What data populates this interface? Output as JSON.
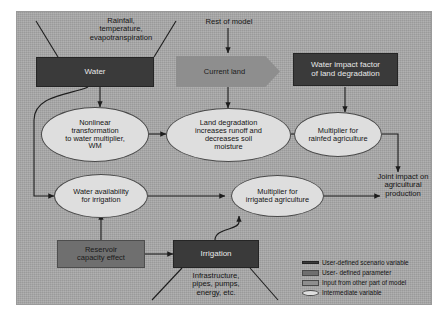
{
  "diagram": {
    "background_color": "#a8a8a8"
  },
  "labels": {
    "rainfall": "Rainfall,\ntemperature,\nevapotranspiration",
    "rest_of_model": "Rest of model",
    "infrastructure": "Infrastructure,\npipes, pumps,\nenergy, etc.",
    "joint_impact": "Joint impact on\nagricultural\nproduction"
  },
  "nodes": {
    "water": {
      "label": "Water",
      "type": "user-defined scenario variable",
      "color": "#3a3a3a"
    },
    "current_land": {
      "label": "Current land",
      "type": "input from other part of model",
      "color": "#8e8e8e"
    },
    "water_impact_factor": {
      "label": "Water impact factor\nof land degradation",
      "type": "user-defined scenario variable",
      "color": "#3a3a3a"
    },
    "nonlinear_transformation": {
      "label": "Nonlinear\ntransformation\nto water multiplier,\nWM",
      "type": "intermediate variable",
      "color": "#dedede"
    },
    "land_degradation": {
      "label": "Land degradation\nincreases runoff and\ndecreases soil\nmoisture",
      "type": "intermediate variable",
      "color": "#dedede"
    },
    "multiplier_rainfed": {
      "label": "Multiplier for\nrainfed agriculture",
      "type": "intermediate variable",
      "color": "#dedede"
    },
    "water_availability": {
      "label": "Water availability\nfor irrigation",
      "type": "intermediate variable",
      "color": "#dedede"
    },
    "multiplier_irrigated": {
      "label": "Multiplier for\nirrigated agriculture",
      "type": "intermediate variable",
      "color": "#dedede"
    },
    "reservoir_capacity": {
      "label": "Reservoir\ncapacity effect",
      "type": "user-defined parameter",
      "color": "#6f6f6f"
    },
    "irrigation": {
      "label": "Irrigation",
      "type": "user-defined scenario variable",
      "color": "#3a3a3a"
    }
  },
  "legend": {
    "items": [
      {
        "label": "User-defined scenario variable",
        "swatch": "scenario",
        "color": "#3a3a3a"
      },
      {
        "label": "User- defined parameter",
        "swatch": "param",
        "color": "#6f6f6f"
      },
      {
        "label": "Input from other part of model",
        "swatch": "input",
        "color": "#8e8e8e"
      },
      {
        "label": "Intermediate variable",
        "swatch": "interm",
        "color": "#dedede"
      }
    ]
  }
}
